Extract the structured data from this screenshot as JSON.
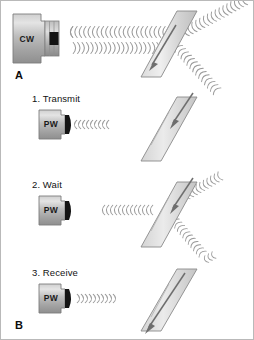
{
  "figure": {
    "background_color": "#ffffff",
    "border_color": "#b9b9b9",
    "width": 254,
    "height": 340
  },
  "panels": [
    {
      "id": "A",
      "part_label": "A",
      "step_label": "",
      "probe_label": "CW",
      "probe_type": "continuous-wave",
      "description": "Continuous wave transducer emitting two continuous wave trains that strike a slanted vessel; beam is transmitted through and reflected downward",
      "beam_mode": "continuous",
      "vessel_flow_direction": "down-left"
    },
    {
      "id": "B1",
      "part_label": "",
      "step_label": "1. Transmit",
      "probe_label": "PW",
      "probe_type": "pulsed-wave",
      "description": "Pulsed wave transducer emits a short burst of ultrasound toward the vessel",
      "beam_mode": "burst-outgoing",
      "vessel_flow_direction": "down-left"
    },
    {
      "id": "B2",
      "part_label": "",
      "step_label": "2. Wait",
      "probe_label": "PW",
      "probe_type": "pulsed-wave",
      "description": "The transducer is silent while the pulse travels to the vessel, passing through and reflecting off it",
      "beam_mode": "burst-at-target",
      "vessel_flow_direction": "down-left"
    },
    {
      "id": "B3",
      "part_label": "B",
      "step_label": "3. Receive",
      "probe_label": "PW",
      "probe_type": "pulsed-wave",
      "description": "The returning echo arrives back at the transducer which listens for it",
      "beam_mode": "burst-returning",
      "vessel_flow_direction": "down-left"
    }
  ],
  "colors": {
    "probe_body_light": "#d9d9d9",
    "probe_body_mid": "#b0b0b0",
    "probe_body_dark": "#8c8c8c",
    "probe_element_dark": "#141414",
    "vessel_light": "#e6e6e6",
    "vessel_mid": "#c7c7c7",
    "vessel_edge": "#7d7d7d",
    "wave_stroke": "#9a9a9a",
    "arrow_fill": "#6e6e6e",
    "text": "#121212"
  },
  "icons": {
    "flow_arrow": "arrow-down-left",
    "wave": "wave-arc"
  }
}
